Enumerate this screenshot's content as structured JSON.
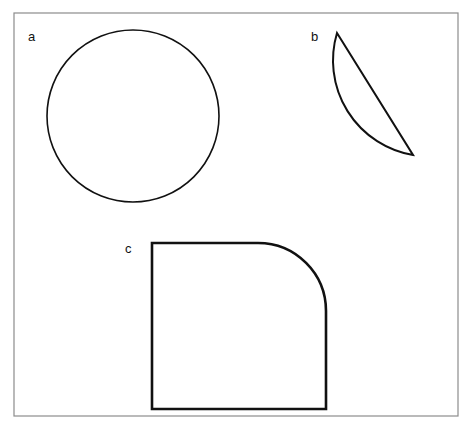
{
  "figure": {
    "background_color": "#ffffff",
    "frame": {
      "name": "figure-border",
      "x": 14,
      "y": 13,
      "width": 444,
      "height": 403,
      "stroke_color": "#8c8c8c",
      "stroke_width": 1.2,
      "fill": "none"
    },
    "stroke_color": "#111111",
    "shapes": [
      {
        "key": "a",
        "label": "a",
        "type": "circle",
        "description": "circle",
        "center_x": 133,
        "center_y": 116,
        "radius": 86,
        "stroke_width": 1.6,
        "fill": "none",
        "label_x": 28,
        "label_y": 30
      },
      {
        "key": "b",
        "label": "b",
        "type": "circular-segment",
        "description": "circular segment with straight chord on the left and arc bulging right",
        "chord_start_x": 337,
        "chord_start_y": 33,
        "chord_end_x": 413,
        "chord_end_y": 155,
        "arc_extreme_x": 425,
        "arc_extreme_y": 100,
        "arc_radius": 96,
        "stroke_width": 2.0,
        "fill": "none",
        "label_x": 311,
        "label_y": 30
      },
      {
        "key": "c",
        "label": "c",
        "type": "square-rounded-corner",
        "description": "square with one rounded corner at top right",
        "x": 152,
        "y": 243,
        "width": 174,
        "height": 166,
        "corner_radius": 68,
        "rounded_corner": "top-right",
        "stroke_width": 2.6,
        "fill": "none",
        "label_x": 125,
        "label_y": 242
      }
    ]
  }
}
